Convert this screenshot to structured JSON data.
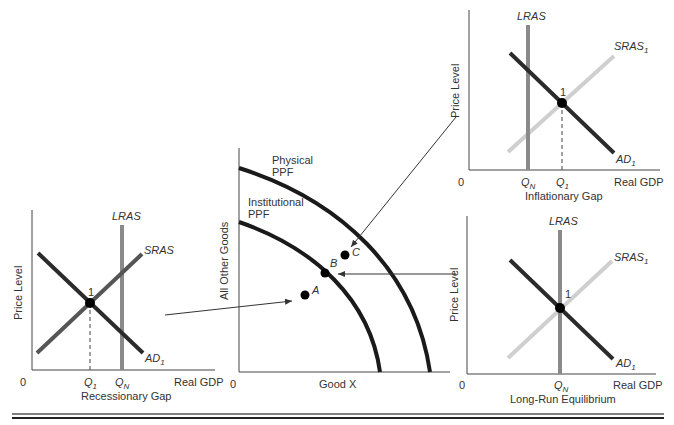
{
  "colors": {
    "dark_curve": "#2b2b2b",
    "lras": "#8a8a8a",
    "sras_light": "#cfcfcf",
    "axis": "#444444",
    "text": "#333333"
  },
  "panels": {
    "recessionary": {
      "y_label": "Price Level",
      "x_label": "Real GDP",
      "origin": "0",
      "title": "Recessionary Gap",
      "lras": "LRAS",
      "sras": "SRAS",
      "ad": "AD",
      "ad_sub": "1",
      "point": "1",
      "q1": "Q",
      "q1_sub": "1",
      "qn": "Q",
      "qn_sub": "N"
    },
    "ppf": {
      "y_label": "All Other Goods",
      "x_label": "Good X",
      "origin": "0",
      "physical_1": "Physical",
      "physical_2": "PPF",
      "institutional_1": "Institutional",
      "institutional_2": "PPF",
      "point_a": "A",
      "point_b": "B",
      "point_c": "C"
    },
    "inflationary": {
      "y_label": "Price Level",
      "x_label": "Real GDP",
      "origin": "0",
      "title": "Inflationary Gap",
      "lras": "LRAS",
      "sras": "SRAS",
      "sras_sub": "1",
      "ad": "AD",
      "ad_sub": "1",
      "point": "1",
      "qn": "Q",
      "qn_sub": "N",
      "q1": "Q",
      "q1_sub": "1"
    },
    "longrun": {
      "y_label": "Price Level",
      "x_label": "Real GDP",
      "origin": "0",
      "title": "Long-Run Equilibrium",
      "lras": "LRAS",
      "sras": "SRAS",
      "sras_sub": "1",
      "ad": "AD",
      "ad_sub": "1",
      "point": "1",
      "qn": "Q",
      "qn_sub": "N"
    }
  }
}
